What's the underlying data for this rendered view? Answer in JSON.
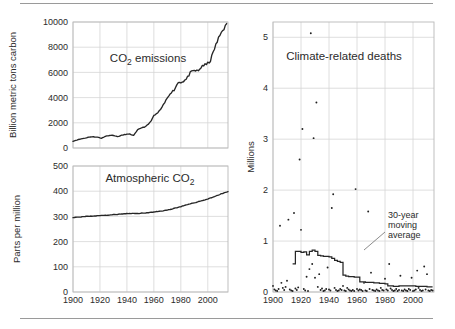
{
  "figure": {
    "background": "#ffffff",
    "line_color": "#262626",
    "grid_color": "#d6d6d6",
    "frame_color": "#b9b9b9"
  },
  "chart_data": [
    {
      "type": "line",
      "title": "CO₂ emissions",
      "id": "co2-emissions",
      "xlabel": "",
      "ylabel": "Billion metric tons carbon",
      "xlim": [
        1900,
        2015
      ],
      "ylim": [
        0,
        10000
      ],
      "xticks": [
        1900,
        1920,
        1940,
        1960,
        1980,
        2000
      ],
      "yticks": [
        0,
        2000,
        4000,
        6000,
        8000,
        10000
      ],
      "grid": true,
      "legend": "none",
      "x": [
        1900,
        1903,
        1906,
        1909,
        1912,
        1915,
        1918,
        1921,
        1924,
        1927,
        1930,
        1933,
        1936,
        1939,
        1942,
        1945,
        1948,
        1951,
        1954,
        1957,
        1960,
        1963,
        1966,
        1969,
        1972,
        1975,
        1978,
        1981,
        1984,
        1987,
        1990,
        1993,
        1996,
        1999,
        2002,
        2005,
        2008,
        2011,
        2014
      ],
      "values": [
        534,
        640,
        720,
        790,
        870,
        880,
        870,
        770,
        935,
        1000,
        1010,
        900,
        1000,
        1080,
        1100,
        1000,
        1440,
        1620,
        1700,
        2010,
        2550,
        2800,
        3200,
        3780,
        4350,
        4600,
        5200,
        5250,
        5450,
        5950,
        6150,
        6100,
        6550,
        6600,
        6950,
        7900,
        8700,
        9400,
        9750
      ]
    },
    {
      "type": "line",
      "title": "Atmospheric CO₂",
      "id": "atmospheric-co2",
      "xlabel": "",
      "ylabel": "Parts per million",
      "xlim": [
        1900,
        2015
      ],
      "ylim": [
        0,
        500
      ],
      "xticks": [
        1900,
        1920,
        1940,
        1960,
        1980,
        2000
      ],
      "yticks": [
        0,
        100,
        200,
        300,
        400,
        500
      ],
      "grid": true,
      "legend": "none",
      "x": [
        1900,
        1910,
        1920,
        1930,
        1940,
        1950,
        1960,
        1970,
        1980,
        1990,
        2000,
        2010,
        2015
      ],
      "values": [
        296,
        300,
        303,
        307,
        311,
        312,
        317,
        325,
        339,
        354,
        369,
        389,
        399
      ]
    },
    {
      "type": "scatter",
      "title": "Climate-related deaths",
      "id": "climate-related-deaths",
      "xlabel": "",
      "ylabel": "Millions",
      "xlim": [
        1900,
        2015
      ],
      "ylim": [
        0,
        5.3
      ],
      "xticks": [
        1900,
        1920,
        1940,
        1960,
        1980,
        2000
      ],
      "yticks": [
        0,
        1,
        2,
        3,
        4,
        5
      ],
      "grid": true,
      "legend": "none",
      "annotation": "30-year\nmoving\naverage",
      "annotation_lines": [
        "30-year",
        "moving",
        "average"
      ],
      "points": [
        [
          1900,
          0.12
        ],
        [
          1901,
          0.05
        ],
        [
          1902,
          0.03
        ],
        [
          1903,
          0.02
        ],
        [
          1904,
          0.06
        ],
        [
          1905,
          1.3
        ],
        [
          1906,
          0.18
        ],
        [
          1907,
          0.08
        ],
        [
          1908,
          0.04
        ],
        [
          1909,
          0.1
        ],
        [
          1910,
          0.22
        ],
        [
          1911,
          1.42
        ],
        [
          1912,
          0.05
        ],
        [
          1913,
          0.03
        ],
        [
          1914,
          0.02
        ],
        [
          1915,
          1.55
        ],
        [
          1916,
          0.07
        ],
        [
          1917,
          0.04
        ],
        [
          1918,
          0.09
        ],
        [
          1919,
          2.6
        ],
        [
          1920,
          1.22
        ],
        [
          1921,
          3.2
        ],
        [
          1922,
          0.06
        ],
        [
          1923,
          0.03
        ],
        [
          1924,
          0.3
        ],
        [
          1925,
          0.02
        ],
        [
          1926,
          0.45
        ],
        [
          1927,
          5.08
        ],
        [
          1928,
          0.55
        ],
        [
          1929,
          3.02
        ],
        [
          1930,
          0.28
        ],
        [
          1931,
          3.72
        ],
        [
          1932,
          0.1
        ],
        [
          1933,
          0.35
        ],
        [
          1934,
          0.04
        ],
        [
          1935,
          0.07
        ],
        [
          1936,
          0.02
        ],
        [
          1937,
          0.03
        ],
        [
          1938,
          0.06
        ],
        [
          1939,
          0.48
        ],
        [
          1940,
          0.05
        ],
        [
          1941,
          0.03
        ],
        [
          1942,
          1.65
        ],
        [
          1943,
          1.92
        ],
        [
          1944,
          0.08
        ],
        [
          1945,
          0.04
        ],
        [
          1946,
          0.02
        ],
        [
          1947,
          0.03
        ],
        [
          1948,
          0.06
        ],
        [
          1949,
          0.04
        ],
        [
          1950,
          0.12
        ],
        [
          1951,
          0.03
        ],
        [
          1952,
          0.02
        ],
        [
          1953,
          0.08
        ],
        [
          1954,
          0.05
        ],
        [
          1955,
          0.03
        ],
        [
          1956,
          0.02
        ],
        [
          1957,
          0.04
        ],
        [
          1958,
          0.02
        ],
        [
          1959,
          2.02
        ],
        [
          1960,
          0.06
        ],
        [
          1961,
          0.03
        ],
        [
          1962,
          0.05
        ],
        [
          1963,
          0.04
        ],
        [
          1964,
          0.02
        ],
        [
          1965,
          0.18
        ],
        [
          1966,
          0.03
        ],
        [
          1967,
          0.02
        ],
        [
          1968,
          1.58
        ],
        [
          1969,
          0.06
        ],
        [
          1970,
          0.38
        ],
        [
          1971,
          0.04
        ],
        [
          1972,
          0.03
        ],
        [
          1973,
          0.02
        ],
        [
          1974,
          0.05
        ],
        [
          1975,
          0.03
        ],
        [
          1976,
          0.02
        ],
        [
          1977,
          0.08
        ],
        [
          1978,
          0.04
        ],
        [
          1979,
          0.03
        ],
        [
          1980,
          0.26
        ],
        [
          1981,
          0.05
        ],
        [
          1982,
          0.03
        ],
        [
          1983,
          0.55
        ],
        [
          1984,
          0.07
        ],
        [
          1985,
          0.04
        ],
        [
          1986,
          0.02
        ],
        [
          1987,
          0.03
        ],
        [
          1988,
          0.06
        ],
        [
          1989,
          0.02
        ],
        [
          1990,
          0.04
        ],
        [
          1991,
          0.32
        ],
        [
          1992,
          0.03
        ],
        [
          1993,
          0.02
        ],
        [
          1994,
          0.05
        ],
        [
          1995,
          0.03
        ],
        [
          1996,
          0.02
        ],
        [
          1997,
          0.06
        ],
        [
          1998,
          0.04
        ],
        [
          1999,
          0.28
        ],
        [
          2000,
          0.02
        ],
        [
          2001,
          0.03
        ],
        [
          2002,
          0.05
        ],
        [
          2003,
          0.42
        ],
        [
          2004,
          0.08
        ],
        [
          2005,
          0.04
        ],
        [
          2006,
          0.02
        ],
        [
          2007,
          0.03
        ],
        [
          2008,
          0.5
        ],
        [
          2009,
          0.05
        ],
        [
          2010,
          0.35
        ],
        [
          2011,
          0.03
        ],
        [
          2012,
          0.02
        ],
        [
          2013,
          0.04
        ],
        [
          2014,
          0.03
        ]
      ],
      "moving_average": {
        "name": "30-year moving average",
        "x": [
          1914,
          1916,
          1918,
          1920,
          1922,
          1924,
          1926,
          1928,
          1930,
          1932,
          1934,
          1936,
          1938,
          1940,
          1942,
          1944,
          1946,
          1948,
          1950,
          1952,
          1954,
          1956,
          1958,
          1960,
          1962,
          1964,
          1966,
          1968,
          1970,
          1972,
          1974,
          1976,
          1978,
          1980,
          1982,
          1984,
          1986,
          1988,
          1990,
          1992,
          1994,
          1996,
          1998,
          2000,
          2002,
          2004,
          2006,
          2008,
          2010,
          2012,
          2014
        ],
        "values": [
          0.55,
          0.8,
          0.8,
          0.78,
          0.79,
          0.73,
          0.8,
          0.82,
          0.8,
          0.72,
          0.71,
          0.7,
          0.7,
          0.69,
          0.66,
          0.62,
          0.6,
          0.58,
          0.33,
          0.31,
          0.3,
          0.3,
          0.29,
          0.29,
          0.2,
          0.2,
          0.19,
          0.19,
          0.19,
          0.18,
          0.18,
          0.17,
          0.17,
          0.16,
          0.12,
          0.12,
          0.11,
          0.11,
          0.12,
          0.12,
          0.12,
          0.12,
          0.12,
          0.12,
          0.11,
          0.11,
          0.11,
          0.11,
          0.1,
          0.1,
          0.1
        ]
      }
    }
  ]
}
